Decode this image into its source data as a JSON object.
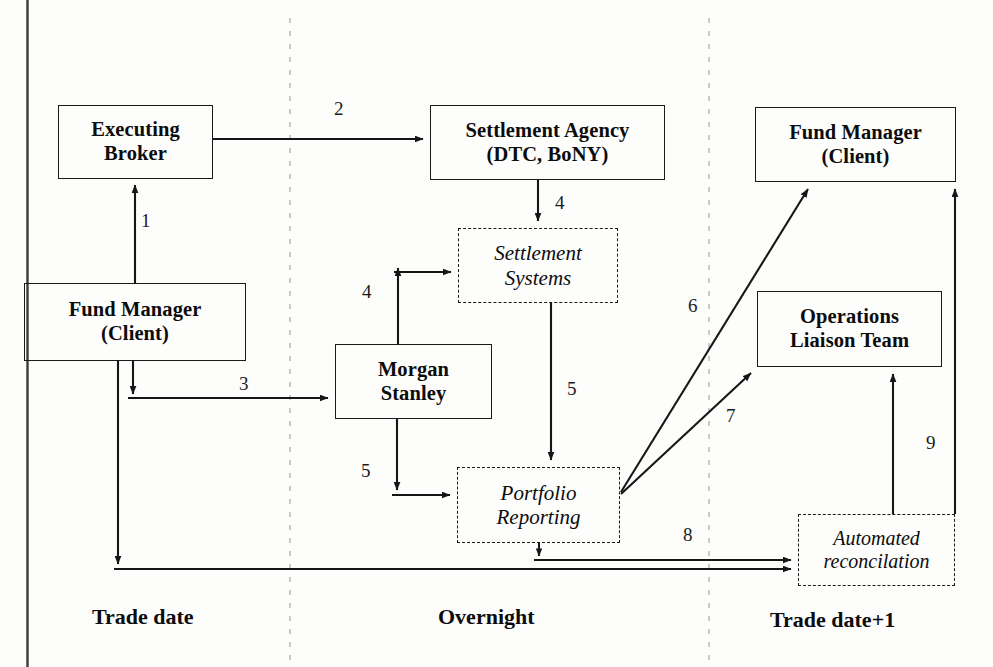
{
  "diagram": {
    "colors": {
      "stroke": "#1a1a1a",
      "divider": "#b9b9b9",
      "text": "#0c0c0c",
      "background": "#fdfdfc"
    },
    "frame": {
      "left_border_visible": true
    },
    "nodes": [
      {
        "id": "executing-broker",
        "style": "solid",
        "line1": "Executing",
        "line2": "Broker",
        "x": 58,
        "y": 105,
        "w": 155,
        "h": 74
      },
      {
        "id": "fund-manager-left",
        "style": "solid",
        "line1": "Fund Manager",
        "line2": "(Client)",
        "x": 24,
        "y": 283,
        "w": 222,
        "h": 78
      },
      {
        "id": "settlement-agency",
        "style": "solid",
        "line1": "Settlement Agency",
        "line2": "(DTC, BoNY)",
        "x": 430,
        "y": 105,
        "w": 235,
        "h": 75
      },
      {
        "id": "settlement-systems",
        "style": "dashed",
        "line1": "Settlement",
        "line2": "Systems",
        "x": 458,
        "y": 228,
        "w": 160,
        "h": 75
      },
      {
        "id": "morgan-stanley",
        "style": "solid",
        "line1": "Morgan",
        "line2": "Stanley",
        "x": 335,
        "y": 344,
        "w": 157,
        "h": 75
      },
      {
        "id": "portfolio-reporting",
        "style": "dashed",
        "line1": "Portfolio",
        "line2": "Reporting",
        "x": 457,
        "y": 467,
        "w": 163,
        "h": 76
      },
      {
        "id": "fund-manager-right",
        "style": "solid",
        "line1": "Fund Manager",
        "line2": "(Client)",
        "x": 755,
        "y": 107,
        "w": 201,
        "h": 75
      },
      {
        "id": "operations-liaison-team",
        "style": "solid",
        "line1": "Operations",
        "line2": "Liaison Team",
        "x": 757,
        "y": 291,
        "w": 185,
        "h": 76
      },
      {
        "id": "automated-reconciliation",
        "style": "dashed",
        "line1": "Automated",
        "line2": "reconcilation",
        "x": 798,
        "y": 514,
        "w": 157,
        "h": 72
      }
    ],
    "edge_labels": [
      {
        "id": "label-1",
        "text": "1",
        "x": 141,
        "y": 210
      },
      {
        "id": "label-2",
        "text": "2",
        "x": 334,
        "y": 98
      },
      {
        "id": "label-3",
        "text": "3",
        "x": 239,
        "y": 373
      },
      {
        "id": "label-4-agency",
        "text": "4",
        "x": 555,
        "y": 192
      },
      {
        "id": "label-4-ms",
        "text": "4",
        "x": 362,
        "y": 281
      },
      {
        "id": "label-5-systems",
        "text": "5",
        "x": 567,
        "y": 378
      },
      {
        "id": "label-5-ms",
        "text": "5",
        "x": 361,
        "y": 460
      },
      {
        "id": "label-6",
        "text": "6",
        "x": 688,
        "y": 295
      },
      {
        "id": "label-7",
        "text": "7",
        "x": 726,
        "y": 405
      },
      {
        "id": "label-8",
        "text": "8",
        "x": 683,
        "y": 524
      },
      {
        "id": "label-9",
        "text": "9",
        "x": 926,
        "y": 432
      }
    ],
    "phase_labels": [
      {
        "id": "phase-trade-date",
        "text": "Trade date",
        "x": 92,
        "y": 604
      },
      {
        "id": "phase-overnight",
        "text": "Overnight",
        "x": 438,
        "y": 604
      },
      {
        "id": "phase-trade-date-1",
        "text": "Trade date+1",
        "x": 770,
        "y": 607
      }
    ],
    "dividers": [
      {
        "id": "divider-trade-overnight",
        "x": 290,
        "y1": 18,
        "y2": 660
      },
      {
        "id": "divider-overnight-next",
        "x": 709,
        "y1": 18,
        "y2": 660
      }
    ],
    "connectors": [
      {
        "id": "conn-1",
        "label": "1",
        "from": "fund-manager-left",
        "to": "executing-broker"
      },
      {
        "id": "conn-2",
        "label": "2",
        "from": "executing-broker",
        "to": "settlement-agency"
      },
      {
        "id": "conn-3",
        "label": "3",
        "from": "fund-manager-left",
        "to": "morgan-stanley"
      },
      {
        "id": "conn-4a",
        "label": "4",
        "from": "settlement-agency",
        "to": "settlement-systems"
      },
      {
        "id": "conn-4b",
        "label": "4",
        "from": "morgan-stanley",
        "to": "settlement-systems"
      },
      {
        "id": "conn-5a",
        "label": "5",
        "from": "settlement-systems",
        "to": "portfolio-reporting"
      },
      {
        "id": "conn-5b",
        "label": "5",
        "from": "morgan-stanley",
        "to": "portfolio-reporting"
      },
      {
        "id": "conn-6",
        "label": "6",
        "from": "portfolio-reporting",
        "to": "fund-manager-right"
      },
      {
        "id": "conn-7",
        "label": "7",
        "from": "portfolio-reporting",
        "to": "operations-liaison-team"
      },
      {
        "id": "conn-8a",
        "label": "8",
        "from": "portfolio-reporting",
        "to": "automated-reconciliation"
      },
      {
        "id": "conn-8b",
        "label": "8",
        "from": "fund-manager-left",
        "to": "automated-reconciliation"
      },
      {
        "id": "conn-9",
        "label": "9",
        "from": "automated-reconciliation",
        "to": "operations-liaison-team"
      },
      {
        "id": "conn-10",
        "label": "",
        "from": "automated-reconciliation",
        "to": "fund-manager-right"
      }
    ]
  }
}
